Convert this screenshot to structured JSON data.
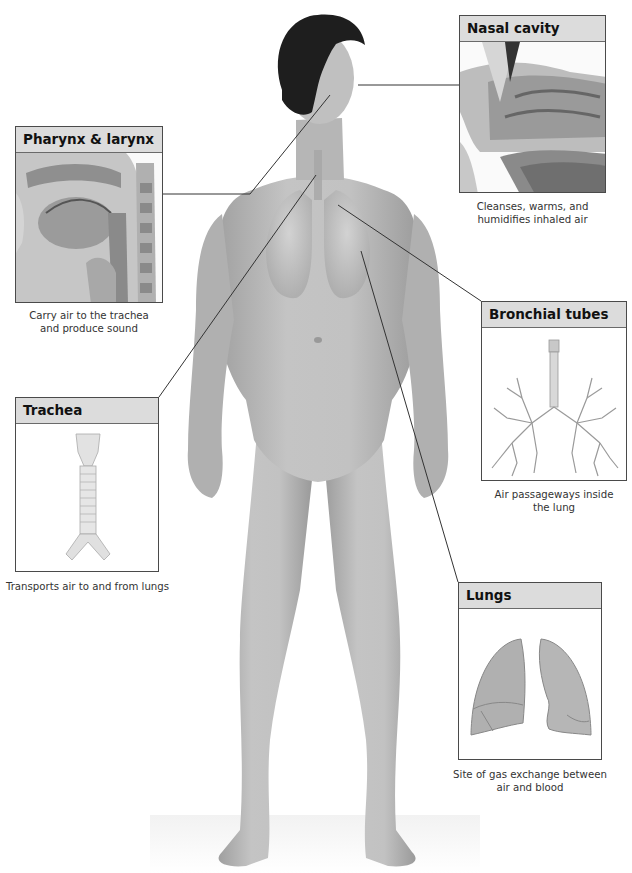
{
  "figure": {
    "central_illustration": "Standing human figure with semi-transparent torso showing lungs and airways"
  },
  "callouts": {
    "nasal_cavity": {
      "title": "Nasal cavity",
      "caption_line1": "Cleanses, warms, and",
      "caption_line2": "humidifies inhaled air"
    },
    "pharynx_larynx": {
      "title": "Pharynx & larynx",
      "caption_line1": "Carry air to the trachea",
      "caption_line2": "and produce sound"
    },
    "bronchial_tubes": {
      "title": "Bronchial tubes",
      "caption_line1": "Air passageways inside",
      "caption_line2": "the lung"
    },
    "trachea": {
      "title": "Trachea",
      "caption_line1": "Transports air to and from lungs",
      "caption_line2": ""
    },
    "lungs": {
      "title": "Lungs",
      "caption_line1": "Site of gas exchange between",
      "caption_line2": "air and blood"
    }
  },
  "colors": {
    "header_fill": "#dcdcdc",
    "box_border": "#4a4a4a",
    "leader_line": "#333333",
    "skin": "#b8b8b8",
    "hair": "#1e1e1e"
  }
}
